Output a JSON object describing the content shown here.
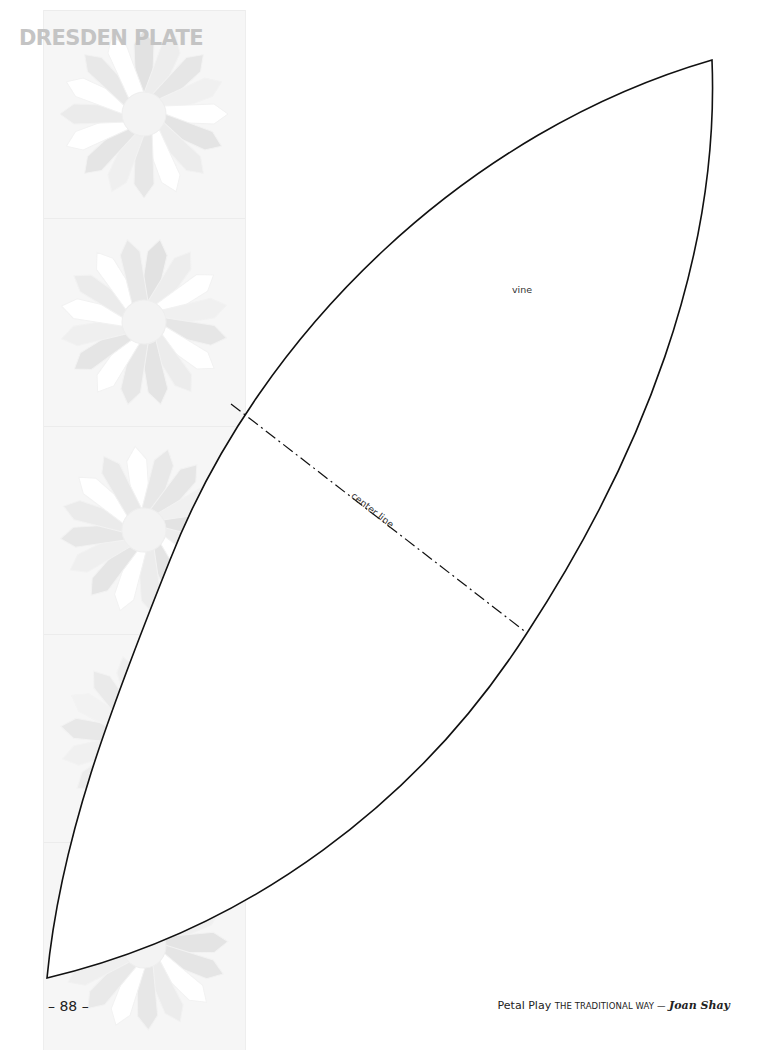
{
  "header": {
    "section_title": "DRESDEN PLATE"
  },
  "template": {
    "shape": "vine",
    "labels": {
      "piece": "vine",
      "center_line": "center line"
    },
    "outline_color": "#111111",
    "background_pattern": {
      "description": "faded Dresden Plate quilt blocks",
      "block_count": 5,
      "colors": [
        "#f6f6f6",
        "#eeeeee",
        "#e6e6e6",
        "#ffffff"
      ]
    }
  },
  "footer": {
    "page_number": "– 88 –",
    "book_title": "Petal Play",
    "subtitle": "THE TRADITIONAL WAY —",
    "author": "Joan Shay"
  }
}
